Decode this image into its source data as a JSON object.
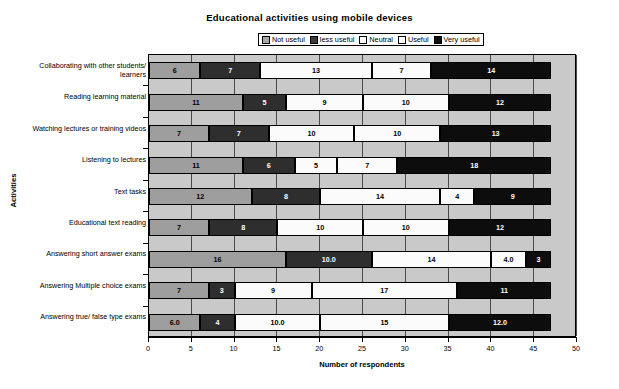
{
  "chart_data": {
    "type": "bar",
    "orientation": "horizontal",
    "stacked": true,
    "title": "Educational activities using mobile devices",
    "xlabel": "Number of respondents",
    "ylabel": "Activities",
    "xlim": [
      0,
      50
    ],
    "xticks": [
      0,
      5,
      10,
      15,
      20,
      25,
      30,
      35,
      40,
      45,
      50
    ],
    "xtick_labels": [
      "0",
      "5",
      "10",
      "15",
      "20",
      "25",
      "30",
      "35",
      "40",
      "45",
      "50"
    ],
    "grid": true,
    "legend_position": "top",
    "categories": [
      "Collaborating with other students/ learners",
      "Reading learning material",
      "Watching lectures  or training videos",
      "Listening to lectures",
      "Text tasks",
      "Educational text reading",
      "Answering short answer exams",
      "Answering Multiple choice exams",
      "Answering true/ false type exams"
    ],
    "series": [
      {
        "name": "Not useful",
        "color": "#9e9e9e",
        "values": [
          6,
          11,
          7,
          11,
          12,
          7,
          16,
          7,
          6.0
        ],
        "labels": [
          "6",
          "11",
          "7",
          "11",
          "12",
          "7",
          "16",
          "7",
          "6.0"
        ]
      },
      {
        "name": "less useful",
        "color": "#2e2e2e",
        "values": [
          7,
          5,
          7,
          6,
          8,
          8,
          10.0,
          3,
          4
        ],
        "labels": [
          "7",
          "5",
          "7",
          "6",
          "8",
          "8",
          "10.0",
          "3",
          "4"
        ]
      },
      {
        "name": "Neutral",
        "color": "#fbfbfb",
        "values": [
          13,
          9,
          10,
          5,
          14,
          10,
          14,
          9,
          10.0
        ],
        "labels": [
          "13",
          "9",
          "10",
          "5",
          "14",
          "10",
          "14",
          "9",
          "10.0"
        ]
      },
      {
        "name": "Useful",
        "color": "#fbfbfb",
        "values": [
          7,
          10,
          10,
          7,
          4,
          10,
          4.0,
          17,
          15
        ],
        "labels": [
          "7",
          "10",
          "10",
          "7",
          "4",
          "10",
          "4.0",
          "17",
          "15"
        ]
      },
      {
        "name": "Very useful",
        "color": "#0d0d0d",
        "values": [
          14,
          12,
          13,
          18,
          9,
          12,
          3,
          11,
          12.0
        ],
        "labels": [
          "14",
          "12",
          "13",
          "18",
          "9",
          "12",
          "3",
          "11",
          "12.0"
        ]
      }
    ]
  },
  "legend": {
    "items": [
      {
        "label": "Not useful",
        "swatch": "sw-notuseful"
      },
      {
        "label": "less useful",
        "swatch": "sw-lessuseful"
      },
      {
        "label": "Neutral",
        "swatch": "sw-neutral"
      },
      {
        "label": "Useful",
        "swatch": "sw-useful"
      },
      {
        "label": "Very useful",
        "swatch": "sw-veryuseful"
      }
    ]
  }
}
